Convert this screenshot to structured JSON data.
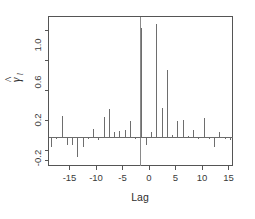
{
  "chart_data": {
    "type": "bar",
    "title": "",
    "subtitle": "",
    "xlabel": "Lag",
    "ylabel": "gamma-hat_l",
    "ylabel_display": "γ",
    "ylabel_sub": "l",
    "ylabel_hat": "^",
    "xlim": [
      -17.5,
      17.5
    ],
    "ylim": [
      -0.28,
      1.22
    ],
    "xticks": [
      -15,
      -10,
      -5,
      0,
      5,
      10,
      15
    ],
    "xticklabels": [
      "-15",
      "-10",
      "-5",
      "0",
      "5",
      "10",
      "15"
    ],
    "yticks": [
      -0.2,
      0.2,
      0.6,
      1.0
    ],
    "yticklabels": [
      "-0.2",
      "0.2",
      "0.6",
      "1.0"
    ],
    "grid": false,
    "legend": false,
    "legend_position": "none",
    "zero_reference_line": 0,
    "baseline": 0,
    "categories": [
      -17,
      -16,
      -15,
      -14,
      -13,
      -12,
      -11,
      -10,
      -9,
      -8,
      -7,
      -6,
      -5,
      -4,
      -3,
      -2,
      -1,
      0,
      1,
      2,
      3,
      4,
      5,
      6,
      7,
      8,
      9,
      10,
      11,
      12,
      13,
      14,
      15,
      16,
      17
    ],
    "values": [
      -0.09,
      -0.01,
      0.22,
      -0.07,
      -0.07,
      -0.19,
      -0.09,
      -0.01,
      0.09,
      -0.02,
      0.21,
      0.29,
      0.06,
      0.07,
      0.08,
      0.17,
      -0.01,
      1.1,
      -0.07,
      0.06,
      1.14,
      0.3,
      0.68,
      0.03,
      0.17,
      0.18,
      0.02,
      0.08,
      -0.01,
      0.2,
      -0.01,
      -0.09,
      0.06,
      -0.01,
      -0.02
    ]
  },
  "axis": {
    "x_title": "Lag",
    "y_title_symbol": "γ",
    "y_title_subscript": "l"
  }
}
